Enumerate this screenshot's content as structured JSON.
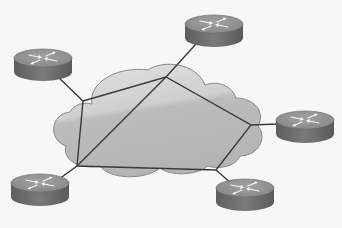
{
  "diagram": {
    "type": "network-topology",
    "cloud": {
      "label": "",
      "fill": "#bdbdbd",
      "highlight": "#dcdcdc",
      "outline": "#7a7a7a",
      "vertices": [
        {
          "id": "A",
          "x": 83,
          "y": 101
        },
        {
          "id": "B",
          "x": 166,
          "y": 77
        },
        {
          "id": "C",
          "x": 251,
          "y": 125
        },
        {
          "id": "D",
          "x": 216,
          "y": 170
        },
        {
          "id": "E",
          "x": 77,
          "y": 166
        }
      ]
    },
    "routers": [
      {
        "id": "router-top-left",
        "cx": 43,
        "cy": 60,
        "icon": "router-icon"
      },
      {
        "id": "router-top-middle",
        "cx": 214,
        "cy": 28,
        "icon": "router-icon"
      },
      {
        "id": "router-right",
        "cx": 305,
        "cy": 125,
        "icon": "router-icon"
      },
      {
        "id": "router-bottom-left",
        "cx": 40,
        "cy": 186,
        "icon": "router-icon"
      },
      {
        "id": "router-bottom-right",
        "cx": 245,
        "cy": 190,
        "icon": "router-icon"
      }
    ],
    "links": [
      {
        "from": "router-top-left",
        "to": "A"
      },
      {
        "from": "router-top-middle",
        "to": "B"
      },
      {
        "from": "router-right",
        "to": "C"
      },
      {
        "from": "router-bottom-right",
        "to": "D"
      },
      {
        "from": "router-bottom-left",
        "to": "E"
      },
      {
        "from": "A",
        "to": "B"
      },
      {
        "from": "B",
        "to": "C"
      },
      {
        "from": "C",
        "to": "D"
      },
      {
        "from": "D",
        "to": "E"
      },
      {
        "from": "E",
        "to": "A"
      },
      {
        "from": "B",
        "to": "E"
      }
    ],
    "colors": {
      "router_top": "#8e8e8e",
      "router_side": "#6b6b6b",
      "router_arrows": "#f2f2f2",
      "link": "#3c3c3c",
      "background": "#f7f7f5"
    }
  }
}
